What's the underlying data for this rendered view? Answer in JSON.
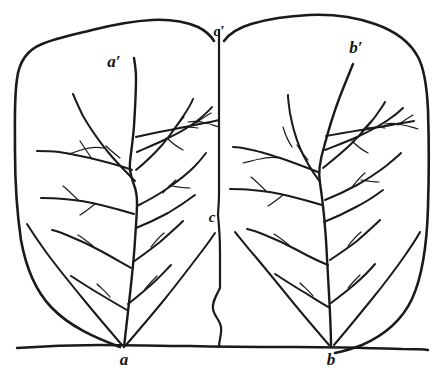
{
  "figure": {
    "background_color": "#ffffff",
    "ink_color": "#1a1a1a",
    "width": 444,
    "height": 373
  },
  "labels": {
    "apex_left": "a′",
    "apex_right": "b′",
    "top_center": "c′",
    "mid_center": "c",
    "base_left": "a",
    "base_right": "b"
  },
  "parts": {
    "left_blade": "left-leaf-blade",
    "right_blade": "right-leaf-blade",
    "left_midrib": "left-midrib",
    "right_midrib": "right-midrib",
    "center_divider": "center-divider",
    "lower_divider": "lower-wavy-divider",
    "baseline": "ground-baseline"
  }
}
